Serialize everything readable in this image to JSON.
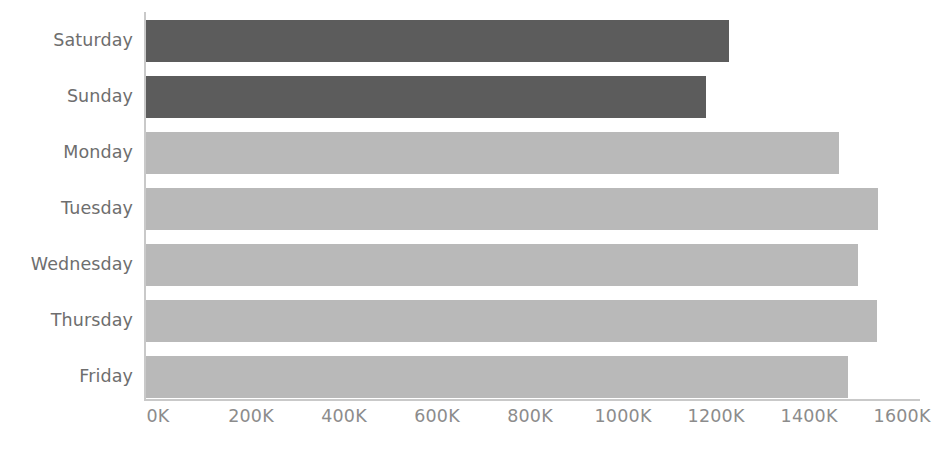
{
  "chart_data": {
    "type": "bar",
    "orientation": "horizontal",
    "title": "",
    "xlabel": "",
    "ylabel": "",
    "categories": [
      "Saturday",
      "Sunday",
      "Monday",
      "Tuesday",
      "Wednesday",
      "Thursday",
      "Friday"
    ],
    "values": [
      1254,
      1204,
      1490,
      1574,
      1531,
      1572,
      1510
    ],
    "value_unit": "K",
    "xlim": [
      0,
      1600
    ],
    "xticks": [
      0,
      200,
      400,
      600,
      800,
      1000,
      1200,
      1400,
      1600
    ],
    "xtick_labels": [
      "0K",
      "200K",
      "400K",
      "600K",
      "800K",
      "1000K",
      "1200K",
      "1400K",
      "1600K"
    ],
    "grid": false,
    "legend": null,
    "bar_colors": [
      "#5c5c5c",
      "#5c5c5c",
      "#b9b9b9",
      "#b9b9b9",
      "#b9b9b9",
      "#b9b9b9",
      "#b9b9b9"
    ],
    "series": [
      {
        "name": "Volume",
        "values": [
          1254,
          1204,
          1490,
          1574,
          1531,
          1572,
          1510
        ]
      }
    ]
  },
  "colors": {
    "weekend_bar": "#5c5c5c",
    "weekday_bar": "#b9b9b9",
    "axis_line": "#c9c9c9",
    "tick_text": "#8c8c8c",
    "category_text": "#6e6e6e",
    "background": "#ffffff"
  },
  "axis": {
    "x_label_0": "0K",
    "x_label_1": "200K",
    "x_label_2": "400K",
    "x_label_3": "600K",
    "x_label_4": "800K",
    "x_label_5": "1000K",
    "x_label_6": "1200K",
    "x_label_7": "1400K",
    "x_label_8": "1600K"
  },
  "categories_text": {
    "c0": "Saturday",
    "c1": "Sunday",
    "c2": "Monday",
    "c3": "Tuesday",
    "c4": "Wednesday",
    "c5": "Thursday",
    "c6": "Friday"
  }
}
